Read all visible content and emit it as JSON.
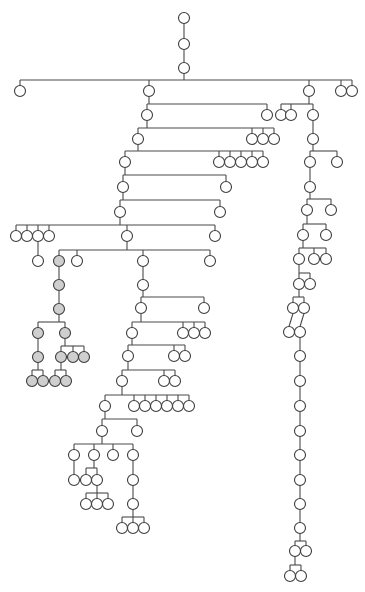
{
  "diagram": {
    "type": "tree",
    "colors": {
      "line": "#4a4a4a",
      "node_stroke": "#3c3c3c",
      "node_fill": "#ffffff",
      "highlight_fill": "#cfcfcf",
      "background": "#ffffff"
    },
    "node_radius": 5.5,
    "nodes": [
      {
        "id": "r0",
        "x": 184,
        "y": 18
      },
      {
        "id": "r1",
        "x": 184,
        "y": 44
      },
      {
        "id": "r2",
        "x": 184,
        "y": 68
      },
      {
        "id": "a1",
        "x": 20,
        "y": 91
      },
      {
        "id": "a2",
        "x": 149,
        "y": 91
      },
      {
        "id": "a3",
        "x": 309,
        "y": 91
      },
      {
        "id": "a4",
        "x": 341,
        "y": 91
      },
      {
        "id": "a5",
        "x": 352,
        "y": 91
      },
      {
        "id": "b1",
        "x": 147,
        "y": 115
      },
      {
        "id": "b2",
        "x": 267,
        "y": 115
      },
      {
        "id": "b3",
        "x": 281,
        "y": 115
      },
      {
        "id": "b4",
        "x": 291,
        "y": 115
      },
      {
        "id": "b5",
        "x": 313,
        "y": 115
      },
      {
        "id": "c1",
        "x": 138,
        "y": 139
      },
      {
        "id": "c2",
        "x": 252,
        "y": 139
      },
      {
        "id": "c3",
        "x": 263,
        "y": 139
      },
      {
        "id": "c4",
        "x": 274,
        "y": 139
      },
      {
        "id": "c5",
        "x": 313,
        "y": 139
      },
      {
        "id": "d1",
        "x": 125,
        "y": 162
      },
      {
        "id": "d2",
        "x": 219,
        "y": 162
      },
      {
        "id": "d3",
        "x": 230,
        "y": 162
      },
      {
        "id": "d4",
        "x": 241,
        "y": 162
      },
      {
        "id": "d5",
        "x": 252,
        "y": 162
      },
      {
        "id": "d6",
        "x": 263,
        "y": 162
      },
      {
        "id": "d7",
        "x": 310,
        "y": 162
      },
      {
        "id": "d8",
        "x": 337,
        "y": 162
      },
      {
        "id": "e1",
        "x": 123,
        "y": 187
      },
      {
        "id": "e2",
        "x": 226,
        "y": 187
      },
      {
        "id": "e3",
        "x": 310,
        "y": 187
      },
      {
        "id": "f1",
        "x": 120,
        "y": 212
      },
      {
        "id": "f2",
        "x": 220,
        "y": 212
      },
      {
        "id": "f3",
        "x": 307,
        "y": 210
      },
      {
        "id": "f4",
        "x": 331,
        "y": 210
      },
      {
        "id": "g1",
        "x": 16,
        "y": 236
      },
      {
        "id": "g2",
        "x": 27,
        "y": 236
      },
      {
        "id": "g3",
        "x": 38,
        "y": 236
      },
      {
        "id": "g4",
        "x": 49,
        "y": 236
      },
      {
        "id": "g5",
        "x": 127,
        "y": 236
      },
      {
        "id": "g6",
        "x": 215,
        "y": 236
      },
      {
        "id": "g7",
        "x": 303,
        "y": 235
      },
      {
        "id": "g8",
        "x": 326,
        "y": 235
      },
      {
        "id": "h1",
        "x": 38,
        "y": 261
      },
      {
        "id": "h2",
        "x": 59,
        "y": 261,
        "hl": true
      },
      {
        "id": "h3",
        "x": 77,
        "y": 261
      },
      {
        "id": "h4",
        "x": 143,
        "y": 261
      },
      {
        "id": "h5",
        "x": 210,
        "y": 261
      },
      {
        "id": "h6",
        "x": 299,
        "y": 259
      },
      {
        "id": "h7",
        "x": 314,
        "y": 259
      },
      {
        "id": "h8",
        "x": 326,
        "y": 259
      },
      {
        "id": "i1",
        "x": 59,
        "y": 285,
        "hl": true
      },
      {
        "id": "i2",
        "x": 143,
        "y": 285
      },
      {
        "id": "i3",
        "x": 299,
        "y": 284
      },
      {
        "id": "i4",
        "x": 310,
        "y": 284
      },
      {
        "id": "j1",
        "x": 59,
        "y": 309,
        "hl": true
      },
      {
        "id": "j2",
        "x": 141,
        "y": 308
      },
      {
        "id": "j3",
        "x": 204,
        "y": 308
      },
      {
        "id": "j4",
        "x": 293,
        "y": 308
      },
      {
        "id": "j5",
        "x": 304,
        "y": 308
      },
      {
        "id": "k1",
        "x": 38,
        "y": 333,
        "hl": true
      },
      {
        "id": "k2",
        "x": 65,
        "y": 333,
        "hl": true
      },
      {
        "id": "k3",
        "x": 132,
        "y": 333
      },
      {
        "id": "k4",
        "x": 183,
        "y": 333
      },
      {
        "id": "k5",
        "x": 194,
        "y": 333
      },
      {
        "id": "k6",
        "x": 205,
        "y": 333
      },
      {
        "id": "k7",
        "x": 289,
        "y": 332
      },
      {
        "id": "k8",
        "x": 300,
        "y": 332
      },
      {
        "id": "l1",
        "x": 38,
        "y": 357,
        "hl": true
      },
      {
        "id": "l2",
        "x": 61,
        "y": 357,
        "hl": true
      },
      {
        "id": "l3",
        "x": 73,
        "y": 357,
        "hl": true
      },
      {
        "id": "l4",
        "x": 84,
        "y": 357,
        "hl": true
      },
      {
        "id": "l5",
        "x": 128,
        "y": 356
      },
      {
        "id": "l6",
        "x": 174,
        "y": 356
      },
      {
        "id": "l7",
        "x": 185,
        "y": 356
      },
      {
        "id": "l8",
        "x": 300,
        "y": 356
      },
      {
        "id": "m1",
        "x": 32,
        "y": 381,
        "hl": true
      },
      {
        "id": "m2",
        "x": 43,
        "y": 381,
        "hl": true
      },
      {
        "id": "m3",
        "x": 55,
        "y": 381,
        "hl": true
      },
      {
        "id": "m4",
        "x": 66,
        "y": 381,
        "hl": true
      },
      {
        "id": "m5",
        "x": 122,
        "y": 381
      },
      {
        "id": "m6",
        "x": 164,
        "y": 381
      },
      {
        "id": "m7",
        "x": 175,
        "y": 381
      },
      {
        "id": "m8",
        "x": 300,
        "y": 381
      },
      {
        "id": "n1",
        "x": 105,
        "y": 406
      },
      {
        "id": "n2",
        "x": 134,
        "y": 406
      },
      {
        "id": "n3",
        "x": 145,
        "y": 406
      },
      {
        "id": "n4",
        "x": 156,
        "y": 406
      },
      {
        "id": "n5",
        "x": 167,
        "y": 406
      },
      {
        "id": "n6",
        "x": 178,
        "y": 406
      },
      {
        "id": "n7",
        "x": 189,
        "y": 406
      },
      {
        "id": "n8",
        "x": 300,
        "y": 406
      },
      {
        "id": "o1",
        "x": 102,
        "y": 431
      },
      {
        "id": "o2",
        "x": 137,
        "y": 431
      },
      {
        "id": "o3",
        "x": 300,
        "y": 431
      },
      {
        "id": "p1",
        "x": 74,
        "y": 455
      },
      {
        "id": "p2",
        "x": 94,
        "y": 455
      },
      {
        "id": "p3",
        "x": 113,
        "y": 455
      },
      {
        "id": "p4",
        "x": 133,
        "y": 455
      },
      {
        "id": "p5",
        "x": 300,
        "y": 455
      },
      {
        "id": "q1",
        "x": 74,
        "y": 480
      },
      {
        "id": "q2",
        "x": 86,
        "y": 480
      },
      {
        "id": "q3",
        "x": 97,
        "y": 480
      },
      {
        "id": "q4",
        "x": 133,
        "y": 480
      },
      {
        "id": "q5",
        "x": 300,
        "y": 480
      },
      {
        "id": "s1",
        "x": 86,
        "y": 504
      },
      {
        "id": "s2",
        "x": 97,
        "y": 504
      },
      {
        "id": "s3",
        "x": 108,
        "y": 504
      },
      {
        "id": "s4",
        "x": 133,
        "y": 504
      },
      {
        "id": "s5",
        "x": 300,
        "y": 504
      },
      {
        "id": "t1",
        "x": 122,
        "y": 528
      },
      {
        "id": "t2",
        "x": 133,
        "y": 528
      },
      {
        "id": "t3",
        "x": 144,
        "y": 528
      },
      {
        "id": "t4",
        "x": 300,
        "y": 528
      },
      {
        "id": "u1",
        "x": 295,
        "y": 551
      },
      {
        "id": "u2",
        "x": 306,
        "y": 551
      },
      {
        "id": "v1",
        "x": 290,
        "y": 576
      },
      {
        "id": "v2",
        "x": 301,
        "y": 576
      }
    ],
    "groups": [
      {
        "parent": "r0",
        "children": [
          "r1"
        ]
      },
      {
        "parent": "r1",
        "children": [
          "r2"
        ]
      },
      {
        "parent": "r2",
        "barY": 80,
        "children": [
          "a1",
          "a2",
          "a3",
          "a4",
          "a5"
        ]
      },
      {
        "parent": "a2",
        "barY": 104,
        "children": [
          "b1",
          "b2"
        ]
      },
      {
        "parent": "a3",
        "barY": 104,
        "children": [
          "b3",
          "b4",
          "b5"
        ]
      },
      {
        "parent": "b1",
        "barY": 128,
        "children": [
          "c1",
          "c2",
          "c3",
          "c4"
        ]
      },
      {
        "parent": "b5",
        "children": [
          "c5"
        ]
      },
      {
        "parent": "c1",
        "barY": 151,
        "children": [
          "d1",
          "d2",
          "d3",
          "d4",
          "d5",
          "d6"
        ]
      },
      {
        "parent": "c5",
        "barY": 151,
        "children": [
          "d7",
          "d8"
        ]
      },
      {
        "parent": "d1",
        "barY": 175,
        "children": [
          "e1",
          "e2"
        ]
      },
      {
        "parent": "d7",
        "children": [
          "e3"
        ]
      },
      {
        "parent": "e1",
        "barY": 200,
        "children": [
          "f1",
          "f2"
        ]
      },
      {
        "parent": "e3",
        "barY": 199,
        "children": [
          "f3",
          "f4"
        ]
      },
      {
        "parent": "f1",
        "barY": 225,
        "children": [
          "g1",
          "g2",
          "g3",
          "g4",
          "g5",
          "g6"
        ]
      },
      {
        "parent": "f3",
        "barY": 224,
        "children": [
          "g7",
          "g8"
        ]
      },
      {
        "parent": "g3",
        "children": [
          "h1"
        ]
      },
      {
        "parent": "g5",
        "barY": 250,
        "children": [
          "h2",
          "h3",
          "h4",
          "h5"
        ]
      },
      {
        "parent": "g7",
        "barY": 248,
        "children": [
          "h6",
          "h7",
          "h8"
        ]
      },
      {
        "parent": "h2",
        "children": [
          "i1"
        ],
        "hl": true
      },
      {
        "parent": "h4",
        "children": [
          "i2"
        ]
      },
      {
        "parent": "h6",
        "barY": 273,
        "children": [
          "i3",
          "i4"
        ]
      },
      {
        "parent": "i1",
        "children": [
          "j1"
        ],
        "hl": true
      },
      {
        "parent": "i2",
        "barY": 297,
        "children": [
          "j2",
          "j3"
        ]
      },
      {
        "parent": "i3",
        "barY": 297,
        "children": [
          "j4",
          "j5"
        ]
      },
      {
        "parent": "j1",
        "barY": 322,
        "children": [
          "k1",
          "k2"
        ],
        "hl": true
      },
      {
        "parent": "j2",
        "barY": 322,
        "children": [
          "k3",
          "k4",
          "k5",
          "k6"
        ]
      },
      {
        "parent": "j4",
        "children": [
          "k7"
        ]
      },
      {
        "parent": "j5",
        "children": [
          "k8"
        ]
      },
      {
        "parent": "k1",
        "children": [
          "l1"
        ],
        "hl": true
      },
      {
        "parent": "k2",
        "barY": 346,
        "children": [
          "l2",
          "l3",
          "l4"
        ],
        "hl": true
      },
      {
        "parent": "k3",
        "barY": 345,
        "children": [
          "l5",
          "l6",
          "l7"
        ]
      },
      {
        "parent": "k8",
        "children": [
          "l8"
        ]
      },
      {
        "parent": "l1",
        "barY": 370,
        "children": [
          "m1",
          "m2"
        ],
        "hl": true
      },
      {
        "parent": "l2",
        "barY": 370,
        "children": [
          "m3",
          "m4"
        ],
        "hl": true
      },
      {
        "parent": "l5",
        "barY": 370,
        "children": [
          "m5",
          "m6",
          "m7"
        ]
      },
      {
        "parent": "l8",
        "children": [
          "m8"
        ]
      },
      {
        "parent": "m5",
        "barY": 395,
        "children": [
          "n1",
          "n2",
          "n3",
          "n4",
          "n5",
          "n6",
          "n7"
        ]
      },
      {
        "parent": "m8",
        "children": [
          "n8"
        ]
      },
      {
        "parent": "n1",
        "barY": 419,
        "children": [
          "o1",
          "o2"
        ]
      },
      {
        "parent": "n8",
        "children": [
          "o3"
        ]
      },
      {
        "parent": "o1",
        "barY": 444,
        "children": [
          "p1",
          "p2",
          "p3",
          "p4"
        ]
      },
      {
        "parent": "o3",
        "children": [
          "p5"
        ]
      },
      {
        "parent": "p1",
        "children": [
          "q1"
        ]
      },
      {
        "parent": "p2",
        "barY": 468,
        "children": [
          "q2",
          "q3"
        ]
      },
      {
        "parent": "p4",
        "children": [
          "q4"
        ]
      },
      {
        "parent": "p5",
        "children": [
          "q5"
        ]
      },
      {
        "parent": "q3",
        "barY": 493,
        "children": [
          "s1",
          "s2",
          "s3"
        ]
      },
      {
        "parent": "q4",
        "children": [
          "s4"
        ]
      },
      {
        "parent": "q5",
        "children": [
          "s5"
        ]
      },
      {
        "parent": "s4",
        "barY": 517,
        "children": [
          "t1",
          "t2",
          "t3"
        ]
      },
      {
        "parent": "s5",
        "children": [
          "t4"
        ]
      },
      {
        "parent": "t4",
        "barY": 541,
        "children": [
          "u1",
          "u2"
        ]
      },
      {
        "parent": "u1",
        "barY": 565,
        "children": [
          "v1",
          "v2"
        ]
      }
    ]
  }
}
